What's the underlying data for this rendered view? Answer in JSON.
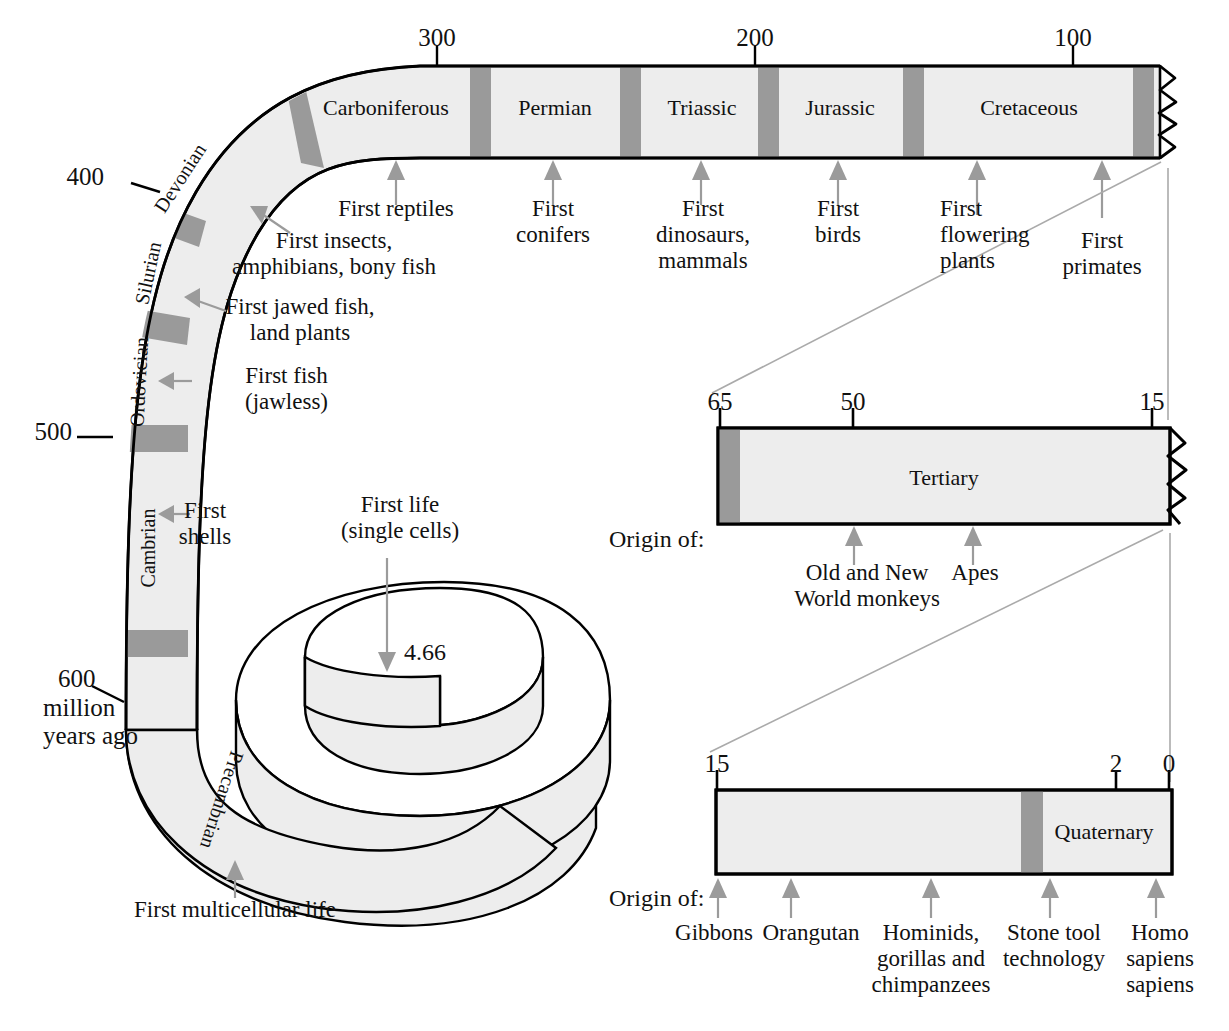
{
  "figure": {
    "type": "geologic-time-spiral",
    "units_note": "million years ago"
  },
  "spiral_band": {
    "periods": [
      {
        "name": "Precambrian",
        "orientation": "rotated"
      },
      {
        "name": "Cambrian",
        "orientation": "rotated"
      },
      {
        "name": "Ordovician",
        "orientation": "rotated"
      },
      {
        "name": "Silurian",
        "orientation": "rotated"
      },
      {
        "name": "Devonian",
        "orientation": "rotated"
      },
      {
        "name": "Carboniferous",
        "orientation": "horizontal"
      },
      {
        "name": "Permian",
        "orientation": "horizontal"
      },
      {
        "name": "Triassic",
        "orientation": "horizontal"
      },
      {
        "name": "Jurassic",
        "orientation": "horizontal"
      },
      {
        "name": "Cretaceous",
        "orientation": "horizontal"
      }
    ],
    "scale_ticks": [
      {
        "label": "300",
        "x": 437
      },
      {
        "label": "200",
        "x": 755
      },
      {
        "label": "100",
        "x": 1073
      },
      {
        "label": "400",
        "x": 131
      },
      {
        "label": "500",
        "x": 77
      },
      {
        "label": "600",
        "x": 92
      }
    ],
    "axis_caption": "million\nyears ago",
    "center_value": "4.66"
  },
  "spiral_annotations": [
    {
      "id": "first-multicellular-life",
      "text": "First multicellular life"
    },
    {
      "id": "first-shells",
      "text": "First\nshells"
    },
    {
      "id": "first-fish-jawless",
      "text": "First fish\n(jawless)"
    },
    {
      "id": "first-jawed-fish",
      "text": "First jawed fish,\nland plants"
    },
    {
      "id": "first-insects",
      "text": "First insects,\namphibians, bony fish"
    },
    {
      "id": "first-life-single-cells",
      "text": "First life\n(single cells)"
    },
    {
      "id": "first-reptiles",
      "text": "First reptiles"
    },
    {
      "id": "first-conifers",
      "text": "First\nconifers"
    },
    {
      "id": "first-dinosaurs-mammals",
      "text": "First\ndinosaurs,\nmammals"
    },
    {
      "id": "first-birds",
      "text": "First\nbirds"
    },
    {
      "id": "first-flowering-plants",
      "text": "First\nflowering\nplants"
    },
    {
      "id": "first-primates",
      "text": "First\nprimates"
    }
  ],
  "tertiary_bar": {
    "period_label": "Tertiary",
    "ticks": [
      {
        "label": "65",
        "x": 720
      },
      {
        "label": "50",
        "x": 853
      },
      {
        "label": "15",
        "x": 1152
      }
    ],
    "origin_label": "Origin of:",
    "events": [
      {
        "text": "Old and New\nWorld monkeys"
      },
      {
        "text": "Apes"
      }
    ]
  },
  "quaternary_bar": {
    "period_label": "Quaternary",
    "ticks": [
      {
        "label": "15",
        "x": 717
      },
      {
        "label": "2",
        "x": 1116
      },
      {
        "label": "0",
        "x": 1169
      }
    ],
    "origin_label": "Origin of:",
    "events": [
      {
        "text": "Gibbons"
      },
      {
        "text": "Orangutan"
      },
      {
        "text": "Hominids,\ngorillas and\nchimpanzees"
      },
      {
        "text": "Stone tool\ntechnology"
      },
      {
        "text": "Homo\nsapiens\nsapiens"
      }
    ]
  },
  "colors": {
    "band_fill": "#ededed",
    "divider_gray": "#9a9a9a",
    "outline": "#000000",
    "arrow_gray": "#9b9b9b",
    "connector_gray": "#aaaaaa",
    "text": "#111111"
  }
}
